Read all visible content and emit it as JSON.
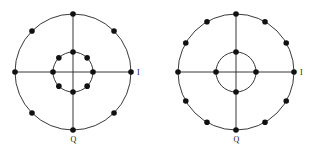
{
  "diagrams": [
    {
      "name": "constellation-8-8",
      "center": [
        73,
        72
      ],
      "outer_radius": 58,
      "inner_radius": 20,
      "outer_points": 8,
      "outer_offset_deg": 0,
      "inner_points": 8,
      "inner_offset_deg": 0,
      "i_label": "I",
      "q_label": "Q"
    },
    {
      "name": "constellation-12-4",
      "center": [
        236,
        72
      ],
      "outer_radius": 58,
      "inner_radius": 20,
      "outer_points": 12,
      "outer_offset_deg": 0,
      "inner_points": 4,
      "inner_offset_deg": 0,
      "i_label": "I",
      "q_label": "Q"
    }
  ]
}
